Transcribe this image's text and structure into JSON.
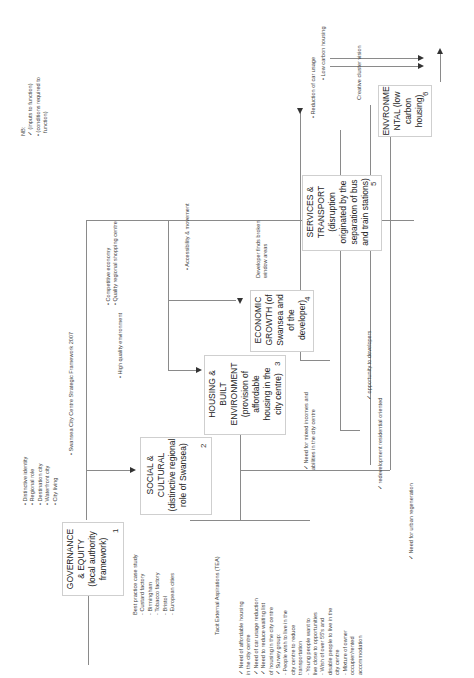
{
  "legend": {
    "title": "NB:",
    "items": [
      {
        "marker": "check-mark",
        "text": "(inputs to function)"
      },
      {
        "marker": "bullet",
        "text": "(conditions required to"
      },
      {
        "marker": "",
        "text": "function)"
      }
    ]
  },
  "nodes": [
    {
      "id": 1,
      "lines": [
        "GOVERNANCE",
        "& EQUITY",
        "(local authority",
        "framework)"
      ],
      "number": "1"
    },
    {
      "id": 2,
      "lines": [
        "SOCIAL &",
        "CULTURAL",
        "(distinctive regional",
        "role of Swansea)"
      ],
      "number": "2"
    },
    {
      "id": 3,
      "lines": [
        "HOUSING &",
        "BUILT",
        "ENVIRONMENT",
        "(provision of",
        "affordable",
        "housing in the",
        "city centre)"
      ],
      "number": "3"
    },
    {
      "id": 4,
      "lines": [
        "ECONOMIC",
        "GROWTH (of",
        "Swansea and",
        "of the",
        "developer)"
      ],
      "number": "4"
    },
    {
      "id": 5,
      "lines": [
        "SERVICES &",
        "TRANSPORT",
        "(disruption",
        "originated by the",
        "separation of bus",
        "and train stations)"
      ],
      "number": "5"
    },
    {
      "id": 6,
      "lines": [
        "ENVRONME",
        "NTAL (low",
        "carbon",
        "housing)"
      ],
      "number": "6"
    }
  ],
  "conditions": {
    "governance": [
      "• Distinctive identity",
      "• Regional role",
      "• Destination city",
      "• Waterfront city",
      "• City living"
    ],
    "framework": "• Swansea City Centre Strategic Framework 2007",
    "housing": "• High quality environment",
    "economic": [
      "• Competitive economy",
      "• Quality regional shopping centre"
    ],
    "transport": "• Accessibility & movement",
    "reduction": "• Reduction of car usage",
    "low_carbon": "• Low carbon housing"
  },
  "inputs": {
    "best_practice": [
      "Best practice case study",
      "- Custard factory",
      "- Birmingham",
      "- Tobacco factory",
      "- Bristol",
      "- European cities"
    ],
    "tea": "Tacit External Aspirations (TEA)",
    "needs": [
      "✓ Need of affordable housing",
      "   in the city centre",
      "✓ Need of car usage reduction",
      "✓ Need to reduce waiting list",
      "   of housing in the city centre",
      "✓ Survey group:",
      "   - People wish to live in the",
      "   city centre to reduce",
      "   transportation",
      "   - Young people want to",
      "   live close to opportunities",
      "   - Wish of over 55's and",
      "   disable people to live in the",
      "   city centre",
      "   - Mixture of owner",
      "   occupier/rented",
      "   accommodation"
    ],
    "urban_regen": "✓ Need for urban regeneration",
    "mixed_incomes": [
      "✓ Need for mixed incomes and",
      "   abilities  in the city centre"
    ],
    "redevelopment": "✓ redevelopment residential oriented",
    "opportunity": "✓ opportunity to developers",
    "broken_window": [
      "Developer finds broken",
      "window areas"
    ],
    "creative": "Creative cluster vision"
  }
}
